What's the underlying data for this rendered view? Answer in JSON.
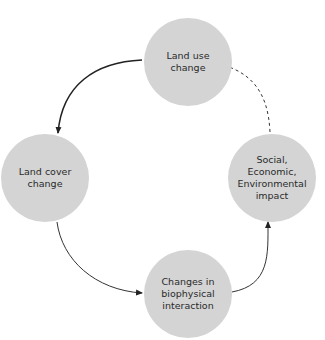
{
  "diagram": {
    "type": "cycle",
    "nodes": [
      {
        "id": "land_use",
        "label": "Land use change"
      },
      {
        "id": "land_cover",
        "label": "Land cover change"
      },
      {
        "id": "biophysical",
        "label": "Changes in biophysical interaction"
      },
      {
        "id": "impact",
        "label": "Social, Economic, Environmental impact"
      }
    ],
    "edges": [
      {
        "from": "land_use",
        "to": "land_cover",
        "style": "solid-thick"
      },
      {
        "from": "land_cover",
        "to": "biophysical",
        "style": "solid"
      },
      {
        "from": "biophysical",
        "to": "impact",
        "style": "solid"
      },
      {
        "from": "impact",
        "to": "land_use",
        "style": "dashed"
      }
    ],
    "colors": {
      "node_fill": "#d4d4d4",
      "edge": "#222222",
      "text": "#2a2a2a"
    }
  }
}
